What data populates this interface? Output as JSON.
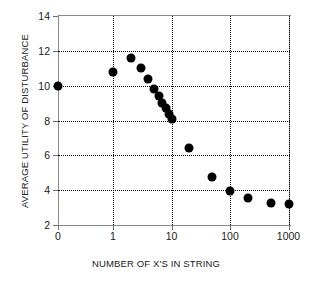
{
  "chart_data": {
    "type": "scatter",
    "title": "",
    "xlabel": "NUMBER OF X'S IN STRING",
    "ylabel": "AVERAGE UTILITY OF DISTURBANCE",
    "xscale": "log-with-zero",
    "x_ticks": [
      "0",
      "1",
      "10",
      "100",
      "1000"
    ],
    "x_tick_values": [
      0,
      1,
      10,
      100,
      1000
    ],
    "y_ticks": [
      "2",
      "4",
      "6",
      "8",
      "10",
      "12",
      "14"
    ],
    "y_tick_values": [
      2,
      4,
      6,
      8,
      10,
      12,
      14
    ],
    "ylim": [
      2,
      14
    ],
    "grid": "dotted",
    "legend": "none",
    "marker": "filled-circle",
    "marker_color": "#000000",
    "points": [
      {
        "x": 0,
        "y": 10.0
      },
      {
        "x": 1,
        "y": 10.8
      },
      {
        "x": 2,
        "y": 11.6
      },
      {
        "x": 3,
        "y": 11.0
      },
      {
        "x": 4,
        "y": 10.4
      },
      {
        "x": 5,
        "y": 9.8
      },
      {
        "x": 6,
        "y": 9.4
      },
      {
        "x": 7,
        "y": 9.0
      },
      {
        "x": 8,
        "y": 8.7
      },
      {
        "x": 9,
        "y": 8.4
      },
      {
        "x": 10,
        "y": 8.1
      },
      {
        "x": 20,
        "y": 6.4
      },
      {
        "x": 50,
        "y": 4.75
      },
      {
        "x": 100,
        "y": 3.95
      },
      {
        "x": 200,
        "y": 3.55
      },
      {
        "x": 500,
        "y": 3.25
      },
      {
        "x": 1000,
        "y": 3.2
      }
    ]
  }
}
